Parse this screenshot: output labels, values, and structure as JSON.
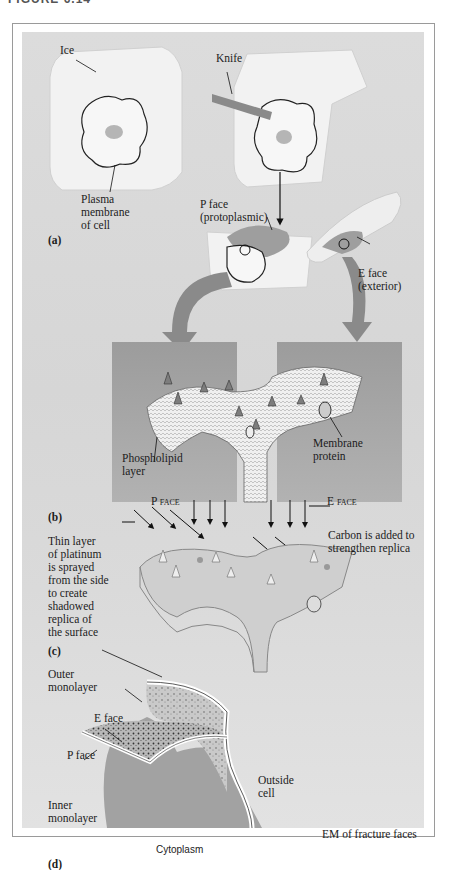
{
  "figure": {
    "header_clipped": "FIGURE 6.14",
    "panels": {
      "a": {
        "label": "(a)",
        "annotations": {
          "ice": "Ice",
          "knife": "Knife",
          "plasma_membrane": "Plasma\nmembrane\nof cell",
          "p_face": "P face\n(protoplasmic)",
          "e_face": "E face\n(exterior)"
        }
      },
      "b": {
        "label": "(b)",
        "annotations": {
          "phospholipid": "Phospholipid\nlayer",
          "membrane_protein": "Membrane\nprotein",
          "p_face_caption": "P face",
          "e_face_caption": "E face"
        }
      },
      "c": {
        "label": "(c)",
        "annotations": {
          "platinum": "Thin layer\nof platinum\nis sprayed\nfrom the side\nto create\nshadowed\nreplica of\nthe surface",
          "carbon": "Carbon is added to\nstrengthen replica"
        }
      },
      "d": {
        "label": "(d)",
        "annotations": {
          "outer_monolayer": "Outer\nmonolayer",
          "e_face": "E face",
          "p_face": "P face",
          "inner_monolayer": "Inner\nmonolayer",
          "outside_cell": "Outside\ncell",
          "cytoplasm": "Cytoplasm",
          "em_caption": "EM of fracture faces"
        }
      }
    }
  },
  "colors": {
    "background": "#d9d9d9",
    "ice_block": "#f1f1f1",
    "bgray_box": "#a9a9a9",
    "membrane_fill": "#ececec",
    "arrow_gray": "#8a8a8a",
    "cytoplasm": "#a2a2a2",
    "e_face_fill": "#c6c6c6"
  }
}
